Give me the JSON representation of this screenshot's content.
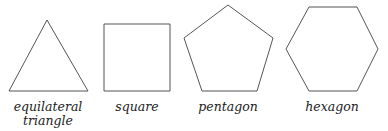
{
  "figure": {
    "stroke_color": "#555555",
    "shapes": [
      {
        "name": "equilateral triangle",
        "label_line1": "equilateral",
        "label_line2": "triangle",
        "sides": 3
      },
      {
        "name": "square",
        "label_line1": "square",
        "sides": 4
      },
      {
        "name": "pentagon",
        "label_line1": "pentagon",
        "sides": 5
      },
      {
        "name": "hexagon",
        "label_line1": "hexagon",
        "sides": 6
      }
    ]
  }
}
